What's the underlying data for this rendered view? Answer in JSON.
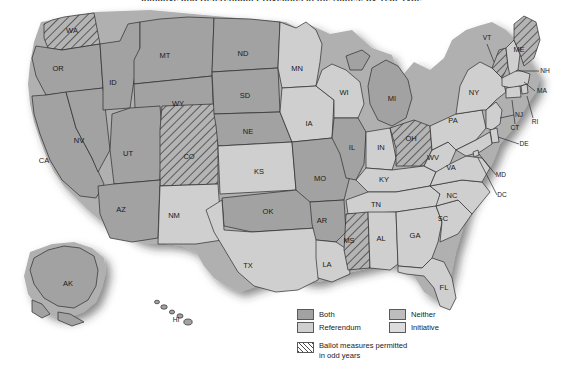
{
  "title": "Initiative and Referendum Provisions in the States, by Year Type",
  "map": {
    "name": "united-states-ballot-measure-map",
    "shadow": true,
    "categories": {
      "both": {
        "label": "Both",
        "color": "#a2a2a2"
      },
      "referendum": {
        "label": "Referendum",
        "color": "#cfcfcf"
      },
      "neither": {
        "label": "Neither",
        "color": "#bdbdbd"
      },
      "initiative": {
        "label": "Initiative",
        "color": "#dcdcdc"
      },
      "odd_years": {
        "label": "Ballot measures permitted in odd years",
        "pattern": "diagonal-hatch"
      }
    },
    "states": [
      {
        "code": "WA",
        "category": "both",
        "odd_years": true,
        "lx": 72,
        "ly": 31
      },
      {
        "code": "OR",
        "category": "both",
        "odd_years": false,
        "lx": 58,
        "ly": 69
      },
      {
        "code": "ID",
        "category": "both",
        "odd_years": false,
        "lx": 113,
        "ly": 83
      },
      {
        "code": "MT",
        "category": "both",
        "odd_years": false,
        "lx": 165,
        "ly": 56
      },
      {
        "code": "WY",
        "category": "both",
        "odd_years": false,
        "lx": 178,
        "ly": 104
      },
      {
        "code": "NV",
        "category": "both",
        "odd_years": false,
        "lx": 79,
        "ly": 141
      },
      {
        "code": "CA",
        "category": "both",
        "odd_years": false,
        "lx": 44,
        "ly": 161
      },
      {
        "code": "UT",
        "category": "both",
        "odd_years": false,
        "lx": 128,
        "ly": 154
      },
      {
        "code": "AZ",
        "category": "both",
        "odd_years": false,
        "lx": 121,
        "ly": 210
      },
      {
        "code": "CO",
        "category": "both",
        "odd_years": true,
        "lx": 189,
        "ly": 157
      },
      {
        "code": "NM",
        "category": "referendum",
        "odd_years": false,
        "lx": 174,
        "ly": 216
      },
      {
        "code": "ND",
        "category": "both",
        "odd_years": false,
        "lx": 243,
        "ly": 54
      },
      {
        "code": "SD",
        "category": "both",
        "odd_years": false,
        "lx": 245,
        "ly": 96
      },
      {
        "code": "NE",
        "category": "both",
        "odd_years": false,
        "lx": 248,
        "ly": 132
      },
      {
        "code": "KS",
        "category": "referendum",
        "odd_years": false,
        "lx": 259,
        "ly": 172
      },
      {
        "code": "OK",
        "category": "both",
        "odd_years": false,
        "lx": 268,
        "ly": 212
      },
      {
        "code": "TX",
        "category": "referendum",
        "odd_years": false,
        "lx": 248,
        "ly": 266
      },
      {
        "code": "MN",
        "category": "referendum",
        "odd_years": false,
        "lx": 297,
        "ly": 69
      },
      {
        "code": "IA",
        "category": "referendum",
        "odd_years": false,
        "lx": 309,
        "ly": 124
      },
      {
        "code": "MO",
        "category": "both",
        "odd_years": false,
        "lx": 320,
        "ly": 179
      },
      {
        "code": "AR",
        "category": "both",
        "odd_years": false,
        "lx": 322,
        "ly": 221
      },
      {
        "code": "LA",
        "category": "referendum",
        "odd_years": false,
        "lx": 327,
        "ly": 265
      },
      {
        "code": "WI",
        "category": "referendum",
        "odd_years": false,
        "lx": 344,
        "ly": 93
      },
      {
        "code": "IL",
        "category": "both",
        "odd_years": false,
        "lx": 352,
        "ly": 148
      },
      {
        "code": "MI",
        "category": "both",
        "odd_years": false,
        "lx": 392,
        "ly": 99
      },
      {
        "code": "IN",
        "category": "referendum",
        "odd_years": false,
        "lx": 381,
        "ly": 148
      },
      {
        "code": "OH",
        "category": "both",
        "odd_years": true,
        "lx": 411,
        "ly": 139
      },
      {
        "code": "KY",
        "category": "referendum",
        "odd_years": false,
        "lx": 384,
        "ly": 180
      },
      {
        "code": "TN",
        "category": "referendum",
        "odd_years": false,
        "lx": 376,
        "ly": 205
      },
      {
        "code": "MS",
        "category": "both",
        "odd_years": true,
        "lx": 349,
        "ly": 241
      },
      {
        "code": "AL",
        "category": "referendum",
        "odd_years": false,
        "lx": 381,
        "ly": 239
      },
      {
        "code": "GA",
        "category": "referendum",
        "odd_years": false,
        "lx": 415,
        "ly": 236
      },
      {
        "code": "FL",
        "category": "referendum",
        "odd_years": false,
        "lx": 444,
        "ly": 288
      },
      {
        "code": "SC",
        "category": "referendum",
        "odd_years": false,
        "lx": 443,
        "ly": 219
      },
      {
        "code": "NC",
        "category": "referendum",
        "odd_years": false,
        "lx": 452,
        "ly": 196
      },
      {
        "code": "VA",
        "category": "referendum",
        "odd_years": false,
        "lx": 451,
        "ly": 168
      },
      {
        "code": "WV",
        "category": "referendum",
        "odd_years": false,
        "lx": 433,
        "ly": 158
      },
      {
        "code": "PA",
        "category": "referendum",
        "odd_years": false,
        "lx": 453,
        "ly": 121
      },
      {
        "code": "NY",
        "category": "referendum",
        "odd_years": false,
        "lx": 474,
        "ly": 93
      },
      {
        "code": "VT",
        "category": "referendum",
        "odd_years": true,
        "lx": 487,
        "ly": 38
      },
      {
        "code": "ME",
        "category": "both",
        "odd_years": true,
        "lx": 519,
        "ly": 50
      },
      {
        "code": "NH",
        "category": "referendum",
        "odd_years": false,
        "lx": 545,
        "ly": 71
      },
      {
        "code": "MA",
        "category": "referendum",
        "odd_years": false,
        "lx": 542,
        "ly": 91
      },
      {
        "code": "RI",
        "category": "referendum",
        "odd_years": false,
        "lx": 535,
        "ly": 122
      },
      {
        "code": "CT",
        "category": "referendum",
        "odd_years": false,
        "lx": 515,
        "ly": 128
      },
      {
        "code": "NJ",
        "category": "referendum",
        "odd_years": false,
        "lx": 519,
        "ly": 115
      },
      {
        "code": "DE",
        "category": "referendum",
        "odd_years": false,
        "lx": 524,
        "ly": 144
      },
      {
        "code": "MD",
        "category": "referendum",
        "odd_years": false,
        "lx": 501,
        "ly": 175
      },
      {
        "code": "DC",
        "category": "referendum",
        "odd_years": false,
        "lx": 502,
        "ly": 195
      },
      {
        "code": "AK",
        "category": "both",
        "odd_years": false,
        "lx": 68,
        "ly": 284
      },
      {
        "code": "HI",
        "category": "referendum",
        "odd_years": false,
        "lx": 176,
        "ly": 320
      }
    ]
  },
  "legend": {
    "name": "map-legend",
    "rows": [
      {
        "left_label": "Both",
        "left_key": "both",
        "right_label": "Neither",
        "right_key": "neither"
      },
      {
        "left_label": "Referendum",
        "left_key": "referendum",
        "right_label": "Initiative",
        "right_key": "initiative"
      }
    ],
    "odd_years_line1": "Ballot measures permitted",
    "odd_years_line2": "in odd years"
  }
}
